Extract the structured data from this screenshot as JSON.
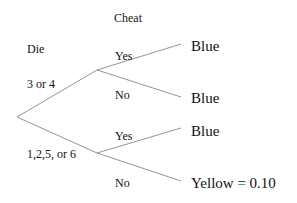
{
  "headers": {
    "die": "Die",
    "cheat": "Cheat"
  },
  "branches": {
    "die_upper": "3 or 4",
    "die_lower": "1,2,5, or 6",
    "upper_yes": "Yes",
    "upper_no": "No",
    "lower_yes": "Yes",
    "lower_no": "No"
  },
  "outcomes": {
    "upper_yes": "Blue",
    "upper_no": "Blue",
    "lower_yes": "Blue",
    "lower_no": "Yellow = 0.10"
  },
  "colors": {
    "line": "#888888",
    "text": "#111111"
  }
}
